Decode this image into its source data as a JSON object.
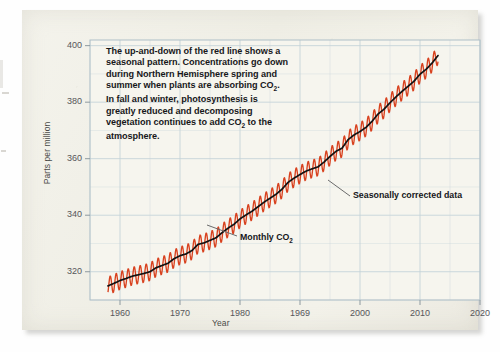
{
  "figure": {
    "kind": "scanned-textbook-figure",
    "card_color": "#f2f1e9"
  },
  "annotation": {
    "lines": [
      "The up-and-down of the red line shows a",
      "seasonal pattern. Concentrations go down",
      "during Northern Hemisphere spring and",
      "summer when plants are absorbing CO₂.",
      "In fall and winter, photosynthesis is",
      "greatly reduced and decomposing",
      "vegetation continues to add CO₂ to the",
      "atmosphere."
    ]
  },
  "callouts": {
    "seasonal": "Seasonally corrected data",
    "monthly": "Monthly CO₂"
  },
  "chart_data": {
    "type": "line",
    "title": "",
    "xlabel": "Year",
    "ylabel": "Parts per million",
    "xlim": [
      1955,
      2020
    ],
    "ylim": [
      310,
      402
    ],
    "xticks": [
      1960,
      1970,
      1980,
      1969,
      2000,
      2010,
      2020
    ],
    "xtick_labels": [
      "1960",
      "1970",
      "1980",
      "1969",
      "2000",
      "2010",
      "2020"
    ],
    "xtick_note": "The fourth tick is printed as 1969 in the source figure (position corresponds to 1990).",
    "yticks": [
      320,
      340,
      360,
      380,
      400
    ],
    "ytick_labels": [
      "320",
      "340",
      "360",
      "380",
      "400"
    ],
    "grid": true,
    "grid_x_step": 5,
    "grid_y_step": 10,
    "grid_color": "#c3d2d8",
    "legend": "none",
    "series": [
      {
        "name": "Monthly CO2",
        "color": "#d8411e",
        "style": "sawtooth-seasonal",
        "seasonal_amplitude_ppm": 3.2
      },
      {
        "name": "Seasonally corrected data",
        "color": "#121212",
        "style": "smooth-trend",
        "x": [
          1958,
          1959,
          1960,
          1961,
          1962,
          1963,
          1964,
          1965,
          1966,
          1967,
          1968,
          1969,
          1970,
          1971,
          1972,
          1973,
          1974,
          1975,
          1976,
          1977,
          1978,
          1979,
          1980,
          1981,
          1982,
          1983,
          1984,
          1985,
          1986,
          1987,
          1988,
          1989,
          1990,
          1991,
          1992,
          1993,
          1994,
          1995,
          1996,
          1997,
          1998,
          1999,
          2000,
          2001,
          2002,
          2003,
          2004,
          2005,
          2006,
          2007,
          2008,
          2009,
          2010,
          2011,
          2012,
          2013
        ],
        "values": [
          315.0,
          315.9,
          316.9,
          317.6,
          318.4,
          318.9,
          319.4,
          320.0,
          321.4,
          322.2,
          323.0,
          324.6,
          325.7,
          326.3,
          327.5,
          329.7,
          330.2,
          331.1,
          332.0,
          333.8,
          335.4,
          336.8,
          338.7,
          340.1,
          341.4,
          343.0,
          344.6,
          346.0,
          347.4,
          349.2,
          351.6,
          353.1,
          354.4,
          355.6,
          356.4,
          357.1,
          358.8,
          360.8,
          362.6,
          363.7,
          366.7,
          368.4,
          369.6,
          371.1,
          373.2,
          375.8,
          377.5,
          379.8,
          381.9,
          383.8,
          385.6,
          387.4,
          389.9,
          391.6,
          393.8,
          396.5
        ]
      }
    ]
  }
}
